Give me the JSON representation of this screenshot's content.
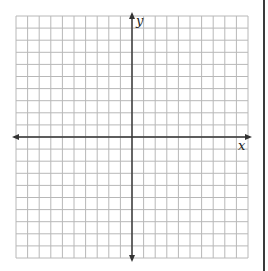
{
  "graph": {
    "x_axis_label": "x",
    "y_axis_label": "y",
    "grid": {
      "columns": 20,
      "rows": 20,
      "left": 16,
      "top": 16,
      "width": 232,
      "height": 242,
      "line_color": "#b8b8b8",
      "axis_color": "#333333"
    },
    "origin": {
      "col": 10,
      "row": 10
    }
  }
}
